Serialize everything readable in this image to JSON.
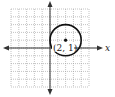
{
  "diagram": {
    "type": "coordinate-plane",
    "grid": {
      "x_min": -5,
      "x_max": 5,
      "y_min": -5,
      "y_max": 5,
      "step": 1,
      "style": "dotted"
    },
    "axes": {
      "x_label": "x",
      "y_label": ""
    },
    "circle": {
      "center": [
        2,
        1
      ],
      "radius": 2
    },
    "point": {
      "coords": [
        2,
        1
      ],
      "label": "(2, 1)"
    },
    "colors": {
      "grid": "#9a9a9a",
      "axis": "#333333",
      "circle": "#111111"
    }
  }
}
